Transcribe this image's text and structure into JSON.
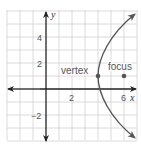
{
  "diagram": {
    "type": "coordinate-plane-parabola",
    "x_axis_label": "x",
    "y_axis_label": "y",
    "x_ticks": [
      {
        "value": 2,
        "label": "2"
      },
      {
        "value": 6,
        "label": "6"
      }
    ],
    "y_ticks": [
      {
        "value": 4,
        "label": "4"
      },
      {
        "value": 2,
        "label": "2"
      },
      {
        "value": -2,
        "label": "−2"
      }
    ],
    "grid": {
      "x_min": -3,
      "x_max": 7,
      "y_min": -4,
      "y_max": 6,
      "unit": 1
    },
    "points": [
      {
        "name": "vertex",
        "label": "vertex",
        "x": 4,
        "y": 1
      },
      {
        "name": "focus",
        "label": "focus",
        "x": 6,
        "y": 1
      }
    ],
    "curve": {
      "equation": "(y-1)^2 = 8(x-4)",
      "opens": "right"
    },
    "colors": {
      "grid": "#d0d0d0",
      "axis": "#222222",
      "curve": "#555555",
      "point": "#555555"
    }
  }
}
